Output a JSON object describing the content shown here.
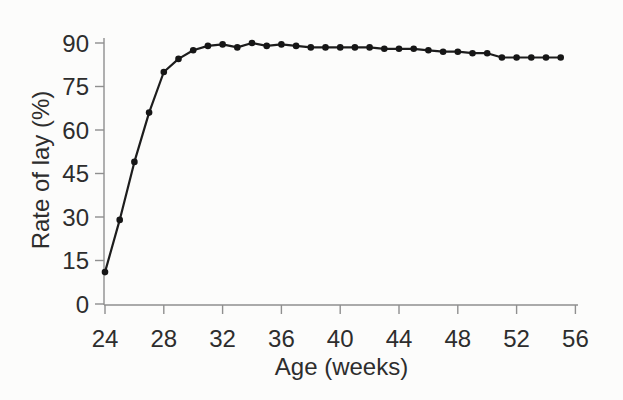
{
  "page": {
    "background": "#fcfcfb",
    "description_of_content": "scanned-style line chart of hen rate of lay versus age in weeks"
  },
  "chart_data": {
    "type": "line",
    "title": "",
    "xlabel": "Age (weeks)",
    "ylabel": "Rate of lay (%)",
    "x": [
      24,
      25,
      26,
      27,
      28,
      29,
      30,
      31,
      32,
      33,
      34,
      35,
      36,
      37,
      38,
      39,
      40,
      41,
      42,
      43,
      44,
      45,
      46,
      47,
      48,
      49,
      50,
      51,
      52,
      53,
      54,
      55
    ],
    "series": [
      {
        "name": "Rate of lay",
        "values": [
          11,
          29,
          49,
          66,
          80,
          84.5,
          87.5,
          89,
          89.5,
          88.5,
          90,
          89,
          89.5,
          89,
          88.5,
          88.5,
          88.5,
          88.5,
          88.5,
          88,
          88,
          88,
          87.5,
          87,
          87,
          86.5,
          86.5,
          85,
          85,
          85,
          85,
          85
        ]
      }
    ],
    "xlim": [
      24,
      56
    ],
    "ylim": [
      0,
      90
    ],
    "xticks": [
      24,
      28,
      32,
      36,
      40,
      44,
      48,
      52,
      56
    ],
    "yticks": [
      0,
      15,
      30,
      45,
      60,
      75,
      90
    ],
    "grid": false,
    "legend": false,
    "marker": "filled-circle",
    "colors": {
      "line": "#1d1d1d",
      "marker": "#161616",
      "axis": "#8f8f8f",
      "text": "#2d2d2d",
      "background": "#fcfcfb"
    }
  }
}
